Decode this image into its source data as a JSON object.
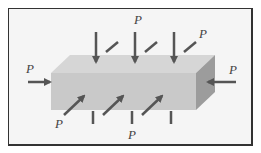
{
  "figure": {
    "labels": {
      "top_center": "P",
      "top_right": "P",
      "left": "P",
      "right": "P",
      "bottom_left": "P",
      "bottom_center": "P"
    },
    "colors": {
      "block_front": "#c8c8c8",
      "block_top": "#d4d4d4",
      "block_side": "#9a9a9a",
      "arrow": "#555555",
      "frame_border": "#333333",
      "background": "#f5f5f5"
    }
  }
}
